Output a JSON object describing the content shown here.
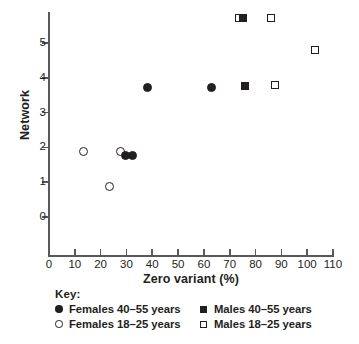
{
  "chart_data": {
    "type": "scatter",
    "title": "",
    "xlabel": "Zero variant (%)",
    "ylabel": "Network",
    "xlim": [
      0,
      110
    ],
    "ylim": [
      0,
      5.8
    ],
    "xticks": [
      0,
      10,
      20,
      30,
      40,
      50,
      60,
      70,
      80,
      90,
      100,
      110
    ],
    "yticks": [
      0,
      1,
      2,
      3,
      4,
      5
    ],
    "grid": false,
    "legend_position": "below-axes",
    "series": [
      {
        "name": "Females 40-55 years",
        "marker": "circle-filled",
        "points": [
          {
            "x": 29.5,
            "y": 1.76
          },
          {
            "x": 32.5,
            "y": 1.77
          },
          {
            "x": 38.0,
            "y": 3.72
          },
          {
            "x": 63.0,
            "y": 3.72
          }
        ]
      },
      {
        "name": "Females 18-25 years",
        "marker": "circle-open",
        "points": [
          {
            "x": 13.5,
            "y": 1.88
          },
          {
            "x": 23.5,
            "y": 0.87
          },
          {
            "x": 27.8,
            "y": 1.88
          }
        ]
      },
      {
        "name": "Males 40-55 years",
        "marker": "square-filled",
        "points": [
          {
            "x": 75.3,
            "y": 5.72
          },
          {
            "x": 75.8,
            "y": 3.77
          }
        ]
      },
      {
        "name": "Males 18-25 years",
        "marker": "square-open",
        "points": [
          {
            "x": 73.5,
            "y": 5.72
          },
          {
            "x": 86.0,
            "y": 5.73
          },
          {
            "x": 87.5,
            "y": 3.79
          },
          {
            "x": 103.0,
            "y": 4.8
          }
        ]
      }
    ]
  },
  "axes": {
    "y_title": "Network",
    "x_title": "Zero variant (%)",
    "y_tick_labels": [
      "5",
      "4",
      "3",
      "2",
      "1",
      "0"
    ],
    "x_tick_labels": [
      "0",
      "10",
      "20",
      "30",
      "40",
      "50",
      "60",
      "70",
      "80",
      "90",
      "100",
      "110"
    ]
  },
  "legend": {
    "title": "Key:",
    "entries": [
      {
        "label": "Females 40–55 years",
        "marker": "circle-filled"
      },
      {
        "label": "Males 40–55 years",
        "marker": "square-filled"
      },
      {
        "label": "Females 18–25 years",
        "marker": "circle-open"
      },
      {
        "label": "Males 18–25 years",
        "marker": "square-open"
      }
    ]
  },
  "colors": {
    "ink": "#231f20",
    "axis": "#58595b",
    "background": "#ffffff"
  }
}
